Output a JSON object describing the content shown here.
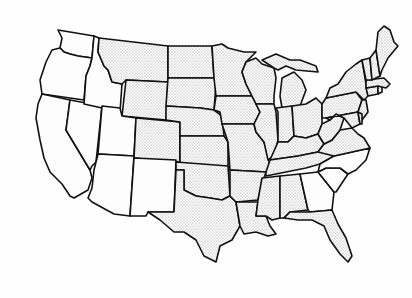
{
  "map": {
    "title": "Contiguous United States",
    "description": "Black-and-white outline map of the 48 contiguous U.S. states; most states have a light stippled fill, some western and southeastern states are unfilled.",
    "colors": {
      "background": "#ffffff",
      "border": "#111111",
      "stipple": "#9a9a9a",
      "plain_fill": "#fdfdfd"
    },
    "states": [
      {
        "id": "WA",
        "name": "Washington",
        "fill": "plain"
      },
      {
        "id": "OR",
        "name": "Oregon",
        "fill": "plain"
      },
      {
        "id": "CA",
        "name": "California",
        "fill": "plain"
      },
      {
        "id": "NV",
        "name": "Nevada",
        "fill": "plain"
      },
      {
        "id": "ID",
        "name": "Idaho",
        "fill": "plain"
      },
      {
        "id": "MT",
        "name": "Montana",
        "fill": "stipple"
      },
      {
        "id": "WY",
        "name": "Wyoming",
        "fill": "stipple"
      },
      {
        "id": "UT",
        "name": "Utah",
        "fill": "plain"
      },
      {
        "id": "AZ",
        "name": "Arizona",
        "fill": "plain"
      },
      {
        "id": "CO",
        "name": "Colorado",
        "fill": "stipple"
      },
      {
        "id": "NM",
        "name": "New Mexico",
        "fill": "plain"
      },
      {
        "id": "ND",
        "name": "North Dakota",
        "fill": "stipple"
      },
      {
        "id": "SD",
        "name": "South Dakota",
        "fill": "stipple"
      },
      {
        "id": "NE",
        "name": "Nebraska",
        "fill": "stipple"
      },
      {
        "id": "KS",
        "name": "Kansas",
        "fill": "stipple"
      },
      {
        "id": "OK",
        "name": "Oklahoma",
        "fill": "stipple"
      },
      {
        "id": "TX",
        "name": "Texas",
        "fill": "stipple"
      },
      {
        "id": "MN",
        "name": "Minnesota",
        "fill": "stipple"
      },
      {
        "id": "IA",
        "name": "Iowa",
        "fill": "stipple"
      },
      {
        "id": "MO",
        "name": "Missouri",
        "fill": "stipple"
      },
      {
        "id": "AR",
        "name": "Arkansas",
        "fill": "stipple"
      },
      {
        "id": "LA",
        "name": "Louisiana",
        "fill": "stipple"
      },
      {
        "id": "WI",
        "name": "Wisconsin",
        "fill": "stipple"
      },
      {
        "id": "IL",
        "name": "Illinois",
        "fill": "stipple"
      },
      {
        "id": "MI",
        "name": "Michigan",
        "fill": "stipple"
      },
      {
        "id": "IN",
        "name": "Indiana",
        "fill": "stipple"
      },
      {
        "id": "OH",
        "name": "Ohio",
        "fill": "stipple"
      },
      {
        "id": "KY",
        "name": "Kentucky",
        "fill": "stipple"
      },
      {
        "id": "TN",
        "name": "Tennessee",
        "fill": "stipple"
      },
      {
        "id": "MS",
        "name": "Mississippi",
        "fill": "stipple"
      },
      {
        "id": "AL",
        "name": "Alabama",
        "fill": "stipple"
      },
      {
        "id": "GA",
        "name": "Georgia",
        "fill": "plain"
      },
      {
        "id": "FL",
        "name": "Florida",
        "fill": "stipple"
      },
      {
        "id": "SC",
        "name": "South Carolina",
        "fill": "plain"
      },
      {
        "id": "NC",
        "name": "North Carolina",
        "fill": "plain"
      },
      {
        "id": "VA",
        "name": "Virginia",
        "fill": "stipple"
      },
      {
        "id": "WV",
        "name": "West Virginia",
        "fill": "stipple"
      },
      {
        "id": "PA",
        "name": "Pennsylvania",
        "fill": "stipple"
      },
      {
        "id": "NY",
        "name": "New York",
        "fill": "stipple"
      },
      {
        "id": "NJ",
        "name": "New Jersey",
        "fill": "stipple"
      },
      {
        "id": "MD",
        "name": "Maryland",
        "fill": "stipple"
      },
      {
        "id": "DE",
        "name": "Delaware",
        "fill": "stipple"
      },
      {
        "id": "CT",
        "name": "Connecticut",
        "fill": "stipple"
      },
      {
        "id": "RI",
        "name": "Rhode Island",
        "fill": "stipple"
      },
      {
        "id": "MA",
        "name": "Massachusetts",
        "fill": "stipple"
      },
      {
        "id": "VT",
        "name": "Vermont",
        "fill": "stipple"
      },
      {
        "id": "NH",
        "name": "New Hampshire",
        "fill": "stipple"
      },
      {
        "id": "ME",
        "name": "Maine",
        "fill": "stipple"
      }
    ]
  }
}
